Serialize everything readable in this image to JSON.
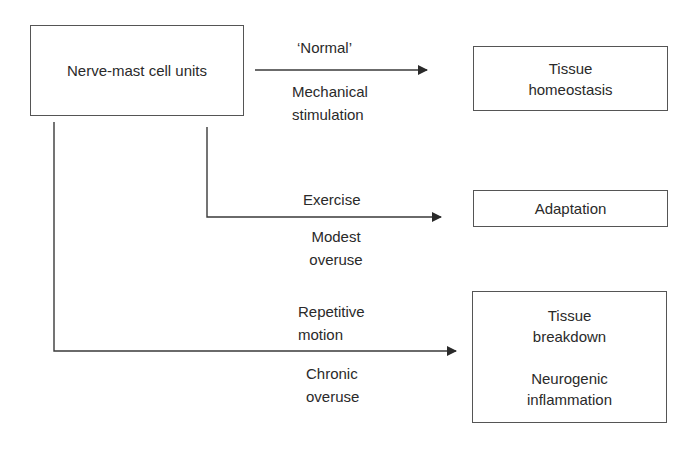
{
  "diagram": {
    "source": {
      "label": "Nerve-mast cell units"
    },
    "outcomes": {
      "homeostasis": {
        "lines": [
          "Tissue",
          "homeostasis"
        ]
      },
      "adaptation": {
        "lines": [
          "Adaptation"
        ]
      },
      "breakdown": {
        "lines": [
          "Tissue",
          "breakdown",
          "Neurogenic",
          "inflammation"
        ]
      }
    },
    "arrows": {
      "normal": {
        "above": "‘Normal’",
        "below": [
          "Mechanical",
          "stimulation"
        ]
      },
      "exercise": {
        "above": "Exercise",
        "below": [
          "Modest",
          "overuse"
        ]
      },
      "repetitive": {
        "above": [
          "Repetitive",
          "motion"
        ],
        "below": [
          "Chronic",
          "overuse"
        ]
      }
    },
    "colors": {
      "line": "#3a3a3a",
      "box_border": "#555555",
      "text": "#2a2a2a"
    }
  }
}
